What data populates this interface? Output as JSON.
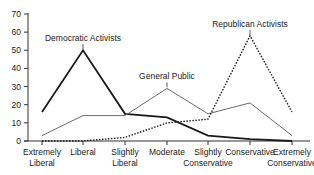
{
  "chart_data": {
    "type": "line",
    "title": "",
    "xlabel": "",
    "ylabel": "",
    "ylim": [
      0,
      70
    ],
    "yticks": [
      0,
      10,
      20,
      30,
      40,
      50,
      60,
      70
    ],
    "grid": false,
    "legend": "inline labels",
    "categories": [
      "Extremely Liberal",
      "Liberal",
      "Slightly Liberal",
      "Moderate",
      "Slightly Conservative",
      "Conservative",
      "Extremely Conservative"
    ],
    "category_lines": [
      [
        "Extremely",
        "Liberal"
      ],
      [
        "Liberal"
      ],
      [
        "Slightly",
        "Liberal"
      ],
      [
        "Moderate"
      ],
      [
        "Slightly",
        "Conservative"
      ],
      [
        "Conservative"
      ],
      [
        "Extremely",
        "Conservative"
      ]
    ],
    "series": [
      {
        "name": "Democratic Activists",
        "values": [
          16,
          50,
          15,
          13,
          3,
          1,
          0
        ],
        "style": "solid-thick",
        "color": "#1a1a1a",
        "label_at": 1
      },
      {
        "name": "General Public",
        "values": [
          3,
          14,
          14,
          29,
          15,
          21,
          3
        ],
        "style": "solid-thin",
        "color": "#6b6b6b",
        "label_at": 3
      },
      {
        "name": "Republican Activists",
        "values": [
          0,
          0,
          2,
          10,
          12,
          58,
          16
        ],
        "style": "dotted",
        "color": "#1a1a1a",
        "label_at": 5
      }
    ]
  }
}
